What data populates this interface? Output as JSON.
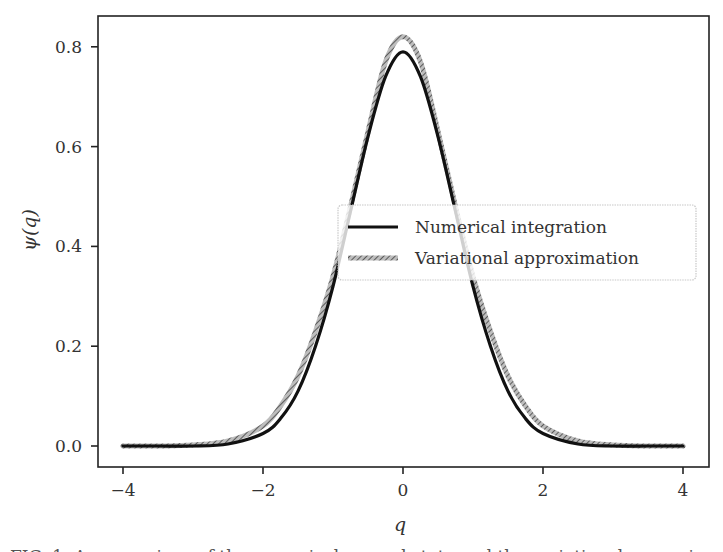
{
  "chart_data": {
    "type": "line",
    "title": "",
    "xlabel": "q",
    "ylabel": "ψ(q)",
    "xlim": [
      -4.4,
      4.4
    ],
    "ylim": [
      -0.04,
      0.86
    ],
    "xticks": [
      -4,
      -2,
      0,
      2,
      4
    ],
    "xtick_labels": [
      "−4",
      "−2",
      "0",
      "2",
      "4"
    ],
    "yticks": [
      0.0,
      0.2,
      0.4,
      0.6,
      0.8
    ],
    "ytick_labels": [
      "0.0",
      "0.2",
      "0.4",
      "0.6",
      "0.8"
    ],
    "grid": false,
    "legend_position": "center right",
    "x": [
      -4.0,
      -3.5,
      -3.0,
      -2.5,
      -2.0,
      -1.75,
      -1.5,
      -1.25,
      -1.0,
      -0.75,
      -0.5,
      -0.25,
      0.0,
      0.25,
      0.5,
      0.75,
      1.0,
      1.25,
      1.5,
      1.75,
      2.0,
      2.5,
      3.0,
      3.5,
      4.0
    ],
    "series": [
      {
        "name": "Numerical integration",
        "color": "#111111",
        "style": "solid",
        "values": [
          0.0,
          0.0,
          0.0,
          0.004,
          0.025,
          0.055,
          0.11,
          0.2,
          0.32,
          0.47,
          0.62,
          0.74,
          0.79,
          0.74,
          0.62,
          0.47,
          0.32,
          0.2,
          0.11,
          0.055,
          0.025,
          0.004,
          0.0,
          0.0,
          0.0
        ]
      },
      {
        "name": "Variational approximation",
        "color": "#8a8a8a",
        "style": "hatched",
        "values": [
          0.0,
          0.0,
          0.002,
          0.01,
          0.04,
          0.08,
          0.14,
          0.23,
          0.34,
          0.48,
          0.63,
          0.77,
          0.82,
          0.77,
          0.63,
          0.48,
          0.34,
          0.23,
          0.14,
          0.08,
          0.04,
          0.01,
          0.002,
          0.0,
          0.0
        ]
      }
    ]
  },
  "caption": {
    "text": "FIG. 1. A comparison of the numerical ground state and the variational approximation."
  }
}
